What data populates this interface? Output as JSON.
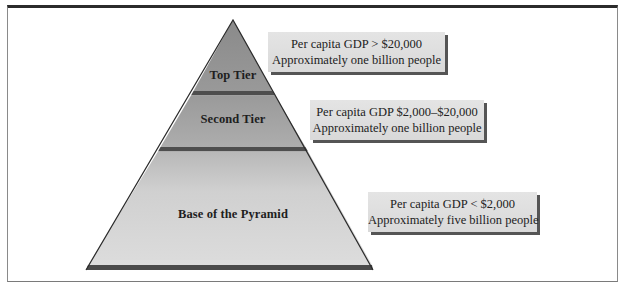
{
  "diagram": {
    "type": "pyramid",
    "tiers": [
      {
        "label": "Top Tier",
        "info": {
          "gdp": "Per capita GDP > $20,000",
          "population": "Approximately one billion people"
        }
      },
      {
        "label": "Second Tier",
        "info": {
          "gdp": "Per capita GDP $2,000–$20,000",
          "population": "Approximately one billion people"
        }
      },
      {
        "label": "Base of the Pyramid",
        "info": {
          "gdp": "Per capita GDP < $2,000",
          "population": "Approximately five billion people"
        }
      }
    ],
    "colors": {
      "top_fill": "#8f8f8f",
      "second_fill": "#a3a3a3",
      "base_fill": "#cfcfcf",
      "divider": "#555555",
      "outline": "#2a2a2a",
      "box_fill": "#dedede",
      "box_shadow": "#555555"
    }
  }
}
